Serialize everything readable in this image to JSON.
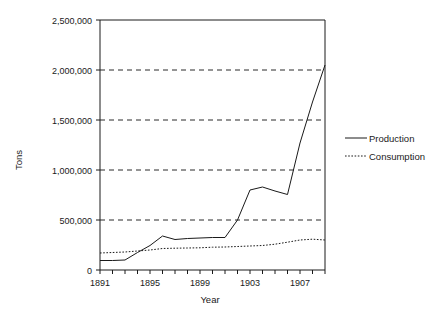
{
  "chart_data": {
    "type": "line",
    "title": "",
    "xlabel": "Year",
    "ylabel": "Tons",
    "xlim": [
      1891,
      1909
    ],
    "ylim": [
      0,
      2500000
    ],
    "grid": true,
    "grid_axis": "y",
    "legend_position": "right",
    "x": [
      1891,
      1892,
      1893,
      1894,
      1895,
      1896,
      1897,
      1898,
      1899,
      1900,
      1901,
      1902,
      1903,
      1904,
      1905,
      1906,
      1907,
      1908,
      1909
    ],
    "y_ticks": [
      0,
      500000,
      1000000,
      1500000,
      2000000,
      2500000
    ],
    "y_tick_labels": [
      "0",
      "500,000",
      "1,000,000",
      "1,500,000",
      "2,000,000",
      "2,500,000"
    ],
    "x_ticks": [
      1891,
      1892,
      1893,
      1894,
      1895,
      1896,
      1897,
      1898,
      1899,
      1900,
      1901,
      1902,
      1903,
      1904,
      1905,
      1906,
      1907,
      1908,
      1909
    ],
    "x_tick_labels": [
      "1891",
      "",
      "",
      "",
      "1895",
      "",
      "",
      "",
      "1899",
      "",
      "",
      "",
      "1903",
      "",
      "",
      "",
      "1907",
      "",
      ""
    ],
    "series": [
      {
        "name": "Production",
        "style": "solid",
        "color": "#1a1a1a",
        "values": [
          95000,
          95000,
          100000,
          175000,
          245000,
          340000,
          305000,
          315000,
          320000,
          325000,
          325000,
          500000,
          800000,
          830000,
          790000,
          755000,
          1270000,
          1680000,
          2050000
        ]
      },
      {
        "name": "Consumption",
        "style": "dotted",
        "color": "#1a1a1a",
        "values": [
          170000,
          175000,
          180000,
          190000,
          200000,
          215000,
          218000,
          220000,
          222000,
          228000,
          230000,
          235000,
          240000,
          245000,
          258000,
          278000,
          300000,
          308000,
          300000
        ]
      }
    ]
  },
  "legend": {
    "items": [
      {
        "label": "Production",
        "style": "solid"
      },
      {
        "label": "Consumption",
        "style": "dotted"
      }
    ]
  },
  "axes": {
    "x_title": "Year",
    "y_title": "Tons"
  }
}
